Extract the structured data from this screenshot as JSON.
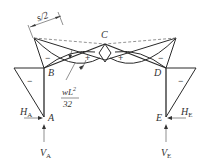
{
  "diagram": {
    "type": "bending-moment-diagram",
    "nodes": {
      "A": "A",
      "B": "B",
      "C": "C",
      "D": "D",
      "E": "E"
    },
    "reactions": {
      "HA": {
        "main": "H",
        "sub": "A"
      },
      "VA": {
        "main": "V",
        "sub": "A"
      },
      "HE": {
        "main": "H",
        "sub": "E"
      },
      "VE": {
        "main": "V",
        "sub": "E"
      }
    },
    "dimension": "s/2",
    "moment_label": {
      "numerator": "wL",
      "exponent": "2",
      "denominator": "32"
    },
    "signs": {
      "left_column": "−",
      "left_rafter_neg": "−",
      "left_rafter_pos": "+",
      "right_rafter_pos": "+",
      "right_rafter_neg": "−",
      "right_column": "−"
    }
  }
}
